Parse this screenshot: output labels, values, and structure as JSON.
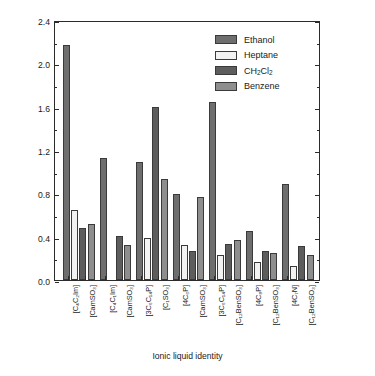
{
  "chart_data": {
    "type": "bar",
    "title": "",
    "xlabel": "Ionic liquid identity",
    "ylabel": "Δf (Hz/100 mg/L gas/µg IL)",
    "ylim": [
      0.0,
      2.4
    ],
    "yticks": [
      "0.0",
      "0.4",
      "0.8",
      "1.2",
      "1.6",
      "2.0",
      "2.4"
    ],
    "grid": false,
    "legend_position": "top-right-inside",
    "categories": [
      "[C4C2Im][CamSO3]",
      "[C4C1Im][CamSO3]",
      "[3C6C14P][C1SO3]",
      "[4C6P][CamSO3]",
      "[3C6C14P][C12BenSO3]",
      "[4C8P][C12BenSO3]",
      "[4C7N][C12BenSO3]"
    ],
    "category_labels": [
      {
        "cation": "[C₄C₂Im]",
        "anion": "[CamSO₃]"
      },
      {
        "cation": "[C₄C₁Im]",
        "anion": "[CamSO₃]"
      },
      {
        "cation": "[3C₆C₁₄P]",
        "anion": "[C₁SO₃]"
      },
      {
        "cation": "[4C₆P]",
        "anion": "[CamSO₃]"
      },
      {
        "cation": "[3C₆C₁₄P]",
        "anion": "[C₁₂BenSO₃]"
      },
      {
        "cation": "[4C₈P]",
        "anion": "[C₁₂BenSO₃]"
      },
      {
        "cation": "[4C₇N]",
        "anion": "[C₁₂BenSO₃]"
      }
    ],
    "series": [
      {
        "name": "Ethanol",
        "color": "#6e6e6e",
        "values": [
          2.17,
          1.13,
          1.09,
          0.79,
          1.64,
          0.45,
          0.89
        ]
      },
      {
        "name": "Heptane",
        "color": "#f2f2f2",
        "values": [
          0.65,
          0.0,
          0.39,
          0.32,
          0.23,
          0.17,
          0.13
        ]
      },
      {
        "name": "CH2Cl2",
        "color": "#5d5d5d",
        "values": [
          0.48,
          0.41,
          1.6,
          0.27,
          0.33,
          0.27,
          0.31
        ]
      },
      {
        "name": "Benzene",
        "color": "#8e8e8e",
        "values": [
          0.52,
          0.32,
          0.93,
          0.77,
          0.37,
          0.25,
          0.23
        ]
      }
    ]
  },
  "legend": {
    "entries": [
      {
        "label": "Ethanol"
      },
      {
        "label": "Heptane"
      },
      {
        "label": "CH",
        "sub1": "2",
        "mid": "Cl",
        "sub2": "2",
        "html": true
      },
      {
        "label": "Benzene"
      }
    ]
  },
  "axis": {
    "y_title_pre": "Δ",
    "y_title_italic": "f",
    "y_title_post": " (Hz/100 mg/L gas/µg IL)",
    "x_title": "Ionic liquid identity"
  }
}
